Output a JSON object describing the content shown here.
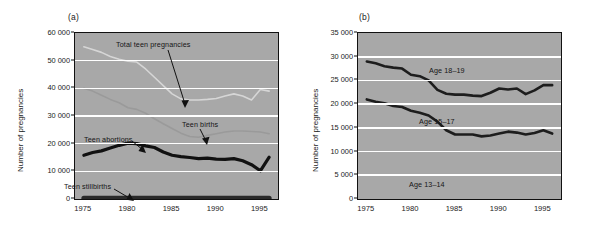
{
  "figure": {
    "panel_a_tag": "(a)",
    "panel_b_tag": "(b)"
  },
  "chart_data": [
    {
      "type": "line",
      "title": "(a)",
      "xlabel": "",
      "ylabel": "Number of pregnancies",
      "xlim": [
        1974,
        1997
      ],
      "ylim": [
        0,
        60000
      ],
      "grid": true,
      "legend_position": "inline-annotations",
      "xticks": [
        "1975",
        "1980",
        "1985",
        "1990",
        "1995"
      ],
      "xtick_values": [
        1975,
        1980,
        1985,
        1990,
        1995
      ],
      "yticks": [
        "0",
        "10 000",
        "20 000",
        "30 000",
        "40 000",
        "50 000",
        "60 000"
      ],
      "ytick_values": [
        0,
        10000,
        20000,
        30000,
        40000,
        50000,
        60000
      ],
      "x": [
        1975,
        1976,
        1977,
        1978,
        1979,
        1980,
        1981,
        1982,
        1983,
        1984,
        1985,
        1986,
        1987,
        1988,
        1989,
        1990,
        1991,
        1992,
        1993,
        1994,
        1995,
        1996
      ],
      "series": [
        {
          "name": "Total teen pregnancies",
          "color": "#d6d6d6",
          "values": [
            55000,
            54000,
            53000,
            51500,
            50500,
            49800,
            49500,
            47000,
            44000,
            41000,
            38000,
            36200,
            35800,
            35800,
            36000,
            36300,
            37200,
            38000,
            37200,
            35800,
            39600,
            39000
          ]
        },
        {
          "name": "Teen births",
          "color": "#9a9a9a",
          "values": [
            40000,
            39000,
            37500,
            36000,
            34800,
            33000,
            32400,
            31000,
            29000,
            27200,
            25500,
            23800,
            22600,
            22300,
            23000,
            23600,
            24200,
            24600,
            24600,
            24400,
            24200,
            23600
          ]
        },
        {
          "name": "Teen abortions",
          "color": "#111111",
          "values": [
            15800,
            16800,
            17400,
            18400,
            19400,
            20200,
            20000,
            19200,
            18600,
            17000,
            15800,
            15300,
            15000,
            14600,
            14800,
            14400,
            14300,
            14600,
            13800,
            12400,
            10200,
            15100
          ]
        },
        {
          "name": "Teen stillbirths",
          "color": "#2a2a2a",
          "values": [
            300,
            300,
            300,
            300,
            300,
            300,
            300,
            300,
            300,
            300,
            300,
            300,
            300,
            300,
            300,
            300,
            300,
            300,
            300,
            300,
            300,
            300
          ]
        }
      ],
      "annotations": [
        {
          "text": "Total teen pregnancies",
          "target_series": "Total teen pregnancies"
        },
        {
          "text": "Teen births",
          "target_series": "Teen births"
        },
        {
          "text": "Teen abortions",
          "target_series": "Teen abortions"
        },
        {
          "text": "Teen stillbirths",
          "target_series": "Teen stillbirths"
        }
      ]
    },
    {
      "type": "line",
      "title": "(b)",
      "xlabel": "",
      "ylabel": "Number of pregnancies",
      "xlim": [
        1974,
        1997
      ],
      "ylim": [
        0,
        35000
      ],
      "grid": true,
      "legend_position": "inline-annotations",
      "xticks": [
        "1975",
        "1980",
        "1985",
        "1990",
        "1995"
      ],
      "xtick_values": [
        1975,
        1980,
        1985,
        1990,
        1995
      ],
      "yticks": [
        "0",
        "5 000",
        "10 000",
        "15 000",
        "20 000",
        "25 000",
        "30 000",
        "35 000"
      ],
      "ytick_values": [
        0,
        5000,
        10000,
        15000,
        20000,
        25000,
        30000,
        35000
      ],
      "x": [
        1975,
        1976,
        1977,
        1978,
        1979,
        1980,
        1981,
        1982,
        1983,
        1984,
        1985,
        1986,
        1987,
        1988,
        1989,
        1990,
        1991,
        1992,
        1993,
        1994,
        1995,
        1996
      ],
      "series": [
        {
          "name": "Age 18-19",
          "color": "#1d1d1d",
          "values": [
            29000,
            28600,
            28000,
            27700,
            27500,
            26200,
            25900,
            25000,
            23000,
            22200,
            22000,
            22000,
            21800,
            21700,
            22400,
            23300,
            23100,
            23300,
            22100,
            22900,
            24000,
            24000
          ]
        },
        {
          "name": "Age 15-17",
          "color": "#1d1d1d",
          "values": [
            21000,
            20500,
            20200,
            19600,
            19400,
            18600,
            18200,
            17600,
            16300,
            14500,
            13600,
            13600,
            13600,
            13200,
            13400,
            13800,
            14200,
            14000,
            13600,
            13900,
            14500,
            13800
          ]
        },
        {
          "name": "Age 13-14",
          "color": "#1d1d1d",
          "values": [
            0,
            0,
            0,
            0,
            0,
            0,
            0,
            0,
            0,
            0,
            0,
            0,
            0,
            0,
            0,
            0,
            0,
            0,
            0,
            0,
            0,
            0
          ]
        }
      ],
      "annotations": [
        {
          "text": "Age 18–19",
          "target_series": "Age 18-19"
        },
        {
          "text": "Age 15–17",
          "target_series": "Age 15-17"
        },
        {
          "text": "Age 13–14",
          "target_series": "Age 13-14"
        }
      ]
    }
  ]
}
